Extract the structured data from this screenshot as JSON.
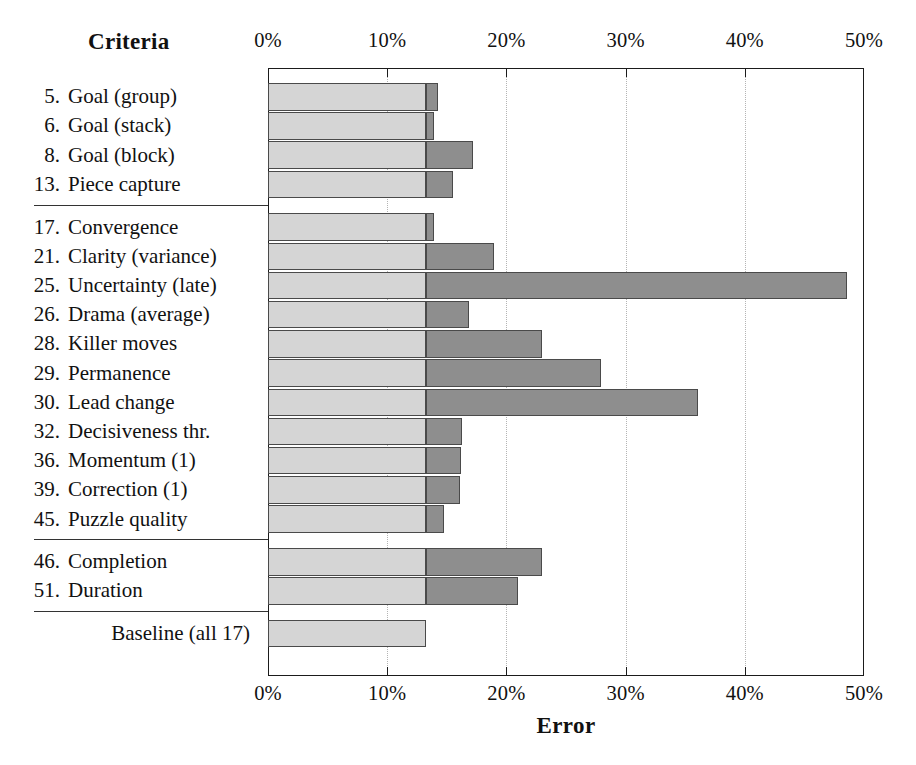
{
  "header": {
    "criteria_title": "Criteria"
  },
  "axis": {
    "x_title": "Error",
    "ticks": [
      "0%",
      "10%",
      "20%",
      "30%",
      "40%",
      "50%"
    ],
    "tick_values": [
      0,
      10,
      20,
      30,
      40,
      50
    ]
  },
  "colors": {
    "base_fill": "#d5d5d5",
    "extension_fill": "#8e8e8e",
    "outline": "#4a4a4a",
    "gridline": "#b4b4b4",
    "text": "#111111"
  },
  "chart_data": {
    "type": "bar",
    "orientation": "horizontal",
    "title": "",
    "xlabel": "Error",
    "ylabel": "Criteria",
    "xlim": [
      0,
      50
    ],
    "xtick_labels": [
      "0%",
      "10%",
      "20%",
      "30%",
      "40%",
      "50%"
    ],
    "xticks": [
      0,
      10,
      20,
      30,
      40,
      50
    ],
    "grid": "vertical-dotted",
    "legend": "none",
    "baseline_value": 13.25,
    "units": "percent",
    "groups": [
      {
        "name": "group-1",
        "rows": [
          {
            "num": "5.",
            "label": "Goal (group)",
            "value": 14.3
          },
          {
            "num": "6.",
            "label": "Goal (stack)",
            "value": 13.9
          },
          {
            "num": "8.",
            "label": "Goal (block)",
            "value": 17.2
          },
          {
            "num": "13.",
            "label": "Piece capture",
            "value": 15.5
          }
        ]
      },
      {
        "name": "group-2",
        "rows": [
          {
            "num": "17.",
            "label": "Convergence",
            "value": 13.9
          },
          {
            "num": "21.",
            "label": "Clarity (variance)",
            "value": 19.0
          },
          {
            "num": "25.",
            "label": "Uncertainty (late)",
            "value": 48.6
          },
          {
            "num": "26.",
            "label": "Drama (average)",
            "value": 16.9
          },
          {
            "num": "28.",
            "label": "Killer moves",
            "value": 23.0
          },
          {
            "num": "29.",
            "label": "Permanence",
            "value": 27.9
          },
          {
            "num": "30.",
            "label": "Lead change",
            "value": 36.1
          },
          {
            "num": "32.",
            "label": "Decisiveness thr.",
            "value": 16.3
          },
          {
            "num": "36.",
            "label": "Momentum (1)",
            "value": 16.2
          },
          {
            "num": "39.",
            "label": "Correction (1)",
            "value": 16.1
          },
          {
            "num": "45.",
            "label": "Puzzle quality",
            "value": 14.8
          }
        ]
      },
      {
        "name": "group-3",
        "rows": [
          {
            "num": "46.",
            "label": "Completion",
            "value": 23.0
          },
          {
            "num": "51.",
            "label": "Duration",
            "value": 21.0
          }
        ]
      },
      {
        "name": "group-4-baseline",
        "rows": [
          {
            "num": "",
            "label": "Baseline (all 17)",
            "value": 13.25
          }
        ]
      }
    ]
  }
}
